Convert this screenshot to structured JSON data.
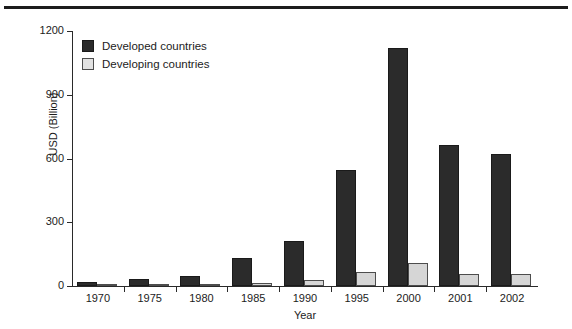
{
  "chart_data": {
    "type": "bar",
    "title": "",
    "subtitle": "",
    "xlabel": "Year",
    "ylabel": "USD (Billion)",
    "categories": [
      "1970",
      "1975",
      "1980",
      "1985",
      "1990",
      "1995",
      "2000",
      "2001",
      "2002"
    ],
    "series": [
      {
        "name": "Developed countries",
        "color": "#2b2b2b",
        "values": [
          18,
          33,
          45,
          130,
          210,
          545,
          1120,
          665,
          620
        ]
      },
      {
        "name": "Developing countries",
        "color": "#d6d6d6",
        "values": [
          3,
          3,
          8,
          12,
          30,
          65,
          110,
          55,
          55
        ]
      }
    ],
    "ylim": [
      0,
      1200
    ],
    "yticks": [
      0,
      300,
      600,
      900,
      1200
    ],
    "ytick_labels": [
      "0",
      "300",
      "600",
      "900",
      "1200"
    ],
    "grid": false,
    "legend_position": "top-left",
    "bar_orientation": "vertical"
  },
  "axes": {
    "y_axis_title": "USD (Billion)",
    "x_axis_title": "Year"
  },
  "legend": {
    "entries": [
      {
        "label": "Developed countries",
        "swatch": "dark-square-swatch"
      },
      {
        "label": "Developing countries",
        "swatch": "light-square-swatch"
      }
    ]
  },
  "colors": {
    "developed": "#2b2b2b",
    "developing": "#d6d6d6",
    "axis": "#2a2a2a",
    "rule": "#1c1c1c",
    "background": "#ffffff"
  }
}
